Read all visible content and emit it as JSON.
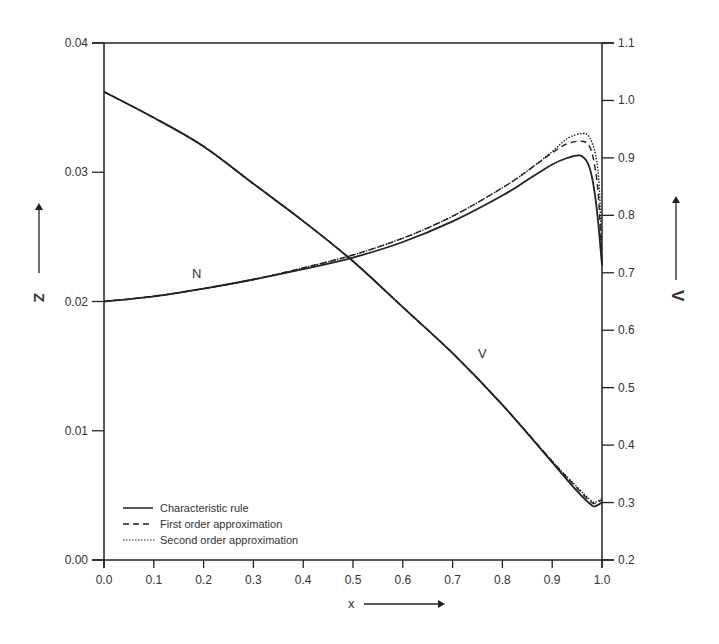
{
  "chart_data": {
    "type": "line",
    "title": "",
    "xlabel": "x",
    "ylabel_left": "Z",
    "ylabel_right": "V",
    "xlim": [
      0.0,
      1.0
    ],
    "ylim_left": [
      0.0,
      0.04
    ],
    "ylim_right": [
      0.2,
      1.1
    ],
    "grid": false,
    "legend_position": "lower left",
    "x_ticks": [
      "0.0",
      "0.1",
      "0.2",
      "0.3",
      "0.4",
      "0.5",
      "0.6",
      "0.7",
      "0.8",
      "0.9",
      "1.0"
    ],
    "y_left_ticks": [
      "0.00",
      "0.01",
      "0.02",
      "0.03",
      "0.04"
    ],
    "y_right_ticks": [
      "0.2",
      "0.3",
      "0.4",
      "0.5",
      "0.6",
      "0.7",
      "0.8",
      "0.9",
      "1.0",
      "1.1"
    ],
    "annotations": [
      {
        "text": "N",
        "x": 0.19,
        "y_axis": "left",
        "y": 0.0213
      },
      {
        "text": "V",
        "x": 0.77,
        "y_axis": "right",
        "y": 0.53
      }
    ],
    "legend": [
      {
        "label": "Characteristic rule",
        "style": "solid"
      },
      {
        "label": "First order approximation",
        "style": "dashed"
      },
      {
        "label": "Second order approximation",
        "style": "dotted"
      }
    ],
    "series": [
      {
        "name": "N - Characteristic rule",
        "curve": "N",
        "axis": "left",
        "style": "solid",
        "x": [
          0.0,
          0.1,
          0.2,
          0.3,
          0.4,
          0.5,
          0.6,
          0.7,
          0.8,
          0.85,
          0.9,
          0.93,
          0.955,
          0.97,
          0.98,
          0.99,
          1.0
        ],
        "values": [
          0.02,
          0.0204,
          0.021,
          0.0217,
          0.0225,
          0.0234,
          0.0246,
          0.0262,
          0.0282,
          0.0294,
          0.0306,
          0.0311,
          0.0313,
          0.0308,
          0.0296,
          0.027,
          0.0228
        ]
      },
      {
        "name": "N - First order approximation",
        "curve": "N",
        "axis": "left",
        "style": "dashed",
        "x": [
          0.0,
          0.1,
          0.2,
          0.3,
          0.4,
          0.5,
          0.6,
          0.7,
          0.8,
          0.85,
          0.9,
          0.93,
          0.96,
          0.975,
          0.985,
          0.993,
          1.0
        ],
        "values": [
          0.02,
          0.0204,
          0.021,
          0.0217,
          0.0226,
          0.0236,
          0.0249,
          0.0266,
          0.0288,
          0.0301,
          0.0315,
          0.0322,
          0.0324,
          0.032,
          0.0306,
          0.028,
          0.0228
        ]
      },
      {
        "name": "N - Second order approximation",
        "curve": "N",
        "axis": "left",
        "style": "dotted",
        "x": [
          0.0,
          0.1,
          0.2,
          0.3,
          0.4,
          0.5,
          0.6,
          0.7,
          0.8,
          0.85,
          0.9,
          0.93,
          0.96,
          0.975,
          0.988,
          0.995,
          1.0
        ],
        "values": [
          0.02,
          0.0204,
          0.021,
          0.0217,
          0.0226,
          0.0236,
          0.0249,
          0.0266,
          0.0288,
          0.0301,
          0.0316,
          0.0326,
          0.033,
          0.0327,
          0.0312,
          0.0285,
          0.0228
        ]
      },
      {
        "name": "V - Characteristic rule",
        "curve": "V",
        "axis": "right",
        "style": "solid",
        "x": [
          0.0,
          0.1,
          0.2,
          0.3,
          0.4,
          0.5,
          0.6,
          0.7,
          0.8,
          0.9,
          0.95,
          0.98,
          0.99,
          1.0
        ],
        "values": [
          1.015,
          0.97,
          0.92,
          0.855,
          0.79,
          0.72,
          0.64,
          0.56,
          0.47,
          0.37,
          0.32,
          0.295,
          0.295,
          0.3
        ]
      },
      {
        "name": "V - First order approximation",
        "curve": "V",
        "axis": "right",
        "style": "dashed",
        "x": [
          0.0,
          0.1,
          0.2,
          0.3,
          0.4,
          0.5,
          0.6,
          0.7,
          0.8,
          0.9,
          0.95,
          0.98,
          0.99,
          1.0
        ],
        "values": [
          1.015,
          0.97,
          0.92,
          0.855,
          0.79,
          0.72,
          0.64,
          0.56,
          0.47,
          0.372,
          0.325,
          0.3,
          0.3,
          0.305
        ]
      },
      {
        "name": "V - Second order approximation",
        "curve": "V",
        "axis": "right",
        "style": "dotted",
        "x": [
          0.0,
          0.1,
          0.2,
          0.3,
          0.4,
          0.5,
          0.6,
          0.7,
          0.8,
          0.9,
          0.95,
          0.98,
          0.99,
          1.0
        ],
        "values": [
          1.015,
          0.97,
          0.92,
          0.855,
          0.79,
          0.72,
          0.64,
          0.56,
          0.47,
          0.372,
          0.327,
          0.302,
          0.302,
          0.307
        ]
      }
    ]
  },
  "labels": {
    "x_axis": "x",
    "y_left_axis": "Z",
    "y_right_axis": "V",
    "curve_n": "N",
    "curve_v": "V",
    "legend_1": "Characteristic rule",
    "legend_2": "First order approximation",
    "legend_3": "Second order approximation"
  }
}
